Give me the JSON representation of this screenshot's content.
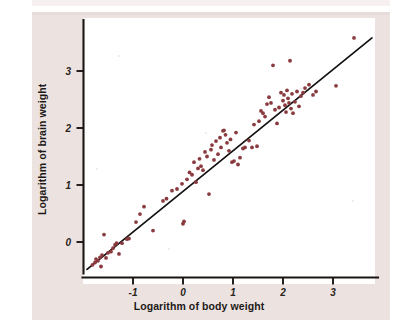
{
  "figure": {
    "background_color": "#ece3e1",
    "plot_background_color": "#ffffff",
    "axis_color": "#1a1613",
    "point_color": "#8a3b3f",
    "line_color": "#141110"
  },
  "chart_data": {
    "type": "scatter",
    "title": "",
    "subtitle": "",
    "xlabel": "Logarithm of body weight",
    "ylabel": "Logarithm of brain weight",
    "xlim": [
      -1.95,
      3.85
    ],
    "ylim": [
      -0.62,
      3.72
    ],
    "xticks": [
      -1,
      0,
      1,
      2,
      3
    ],
    "xtick_labels": [
      "-1",
      "0",
      "1",
      "2",
      "3"
    ],
    "yticks": [
      0,
      1,
      2,
      3
    ],
    "ytick_labels": [
      "0",
      "1",
      "2",
      "3"
    ],
    "grid": false,
    "legend": null,
    "annotations": [],
    "series": [
      {
        "name": "species",
        "marker": "circle",
        "color": "#8a3b3f",
        "points": [
          [
            -1.81,
            -0.4
          ],
          [
            -1.76,
            -0.36
          ],
          [
            -1.74,
            -0.3
          ],
          [
            -1.7,
            -0.33
          ],
          [
            -1.66,
            -0.27
          ],
          [
            -1.64,
            -0.43
          ],
          [
            -1.62,
            -0.23
          ],
          [
            -1.58,
            0.13
          ],
          [
            -1.54,
            -0.28
          ],
          [
            -1.5,
            -0.19
          ],
          [
            -1.44,
            -0.17
          ],
          [
            -1.4,
            -0.11
          ],
          [
            -1.36,
            -0.05
          ],
          [
            -1.33,
            -0.02
          ],
          [
            -1.28,
            -0.21
          ],
          [
            -1.22,
            -0.02
          ],
          [
            -1.12,
            0.05
          ],
          [
            -1.08,
            0.06
          ],
          [
            -0.94,
            0.35
          ],
          [
            -0.86,
            0.49
          ],
          [
            -0.78,
            0.62
          ],
          [
            -0.6,
            0.2
          ],
          [
            -0.4,
            0.72
          ],
          [
            -0.33,
            0.76
          ],
          [
            -0.22,
            0.9
          ],
          [
            -0.12,
            0.93
          ],
          [
            -0.02,
            1.02
          ],
          [
            0.0,
            0.32
          ],
          [
            0.02,
            0.36
          ],
          [
            0.08,
            1.1
          ],
          [
            0.13,
            1.22
          ],
          [
            0.18,
            1.18
          ],
          [
            0.22,
            1.4
          ],
          [
            0.26,
            1.05
          ],
          [
            0.3,
            1.29
          ],
          [
            0.33,
            1.46
          ],
          [
            0.36,
            1.33
          ],
          [
            0.4,
            1.26
          ],
          [
            0.44,
            1.58
          ],
          [
            0.48,
            1.5
          ],
          [
            0.52,
            0.84
          ],
          [
            0.56,
            1.62
          ],
          [
            0.58,
            1.7
          ],
          [
            0.62,
            1.44
          ],
          [
            0.66,
            1.77
          ],
          [
            0.7,
            1.54
          ],
          [
            0.74,
            1.83
          ],
          [
            0.76,
            1.66
          ],
          [
            0.8,
            1.95
          ],
          [
            0.82,
            1.96
          ],
          [
            0.85,
            1.88
          ],
          [
            0.88,
            1.74
          ],
          [
            0.92,
            1.6
          ],
          [
            0.95,
            1.8
          ],
          [
            0.98,
            1.4
          ],
          [
            1.02,
            1.42
          ],
          [
            1.06,
            1.92
          ],
          [
            1.1,
            1.36
          ],
          [
            1.14,
            1.48
          ],
          [
            1.2,
            1.64
          ],
          [
            1.24,
            1.66
          ],
          [
            1.32,
            1.78
          ],
          [
            1.38,
            1.66
          ],
          [
            1.42,
            2.06
          ],
          [
            1.48,
            1.68
          ],
          [
            1.52,
            2.12
          ],
          [
            1.56,
            2.3
          ],
          [
            1.6,
            2.26
          ],
          [
            1.64,
            2.2
          ],
          [
            1.68,
            2.42
          ],
          [
            1.72,
            2.54
          ],
          [
            1.76,
            2.44
          ],
          [
            1.8,
            3.1
          ],
          [
            1.84,
            2.32
          ],
          [
            1.88,
            2.08
          ],
          [
            1.92,
            2.36
          ],
          [
            1.96,
            2.62
          ],
          [
            2.0,
            2.48
          ],
          [
            2.02,
            2.58
          ],
          [
            2.04,
            2.4
          ],
          [
            2.06,
            2.28
          ],
          [
            2.08,
            2.66
          ],
          [
            2.1,
            2.52
          ],
          [
            2.12,
            2.44
          ],
          [
            2.14,
            3.18
          ],
          [
            2.16,
            2.34
          ],
          [
            2.18,
            2.6
          ],
          [
            2.2,
            2.26
          ],
          [
            2.24,
            2.46
          ],
          [
            2.28,
            2.64
          ],
          [
            2.32,
            2.38
          ],
          [
            2.36,
            2.56
          ],
          [
            2.4,
            2.62
          ],
          [
            2.44,
            2.7
          ],
          [
            2.52,
            2.76
          ],
          [
            2.6,
            2.58
          ],
          [
            2.66,
            2.64
          ],
          [
            3.06,
            2.74
          ],
          [
            3.42,
            3.58
          ]
        ]
      }
    ],
    "fit_line": {
      "name": "least-squares regression line",
      "color": "#141110",
      "x_start": -1.92,
      "y_start": -0.48,
      "x_end": 3.78,
      "y_end": 3.58
    }
  }
}
